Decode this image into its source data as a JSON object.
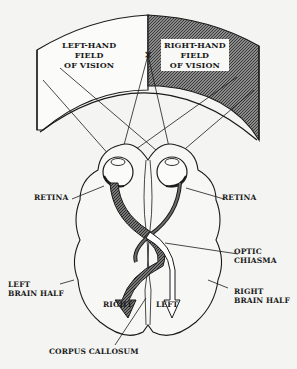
{
  "diagram": {
    "type": "visual-pathway",
    "colors": {
      "background": "#f4f4f2",
      "line": "#1a1a1a",
      "shaded_field": "#6b6b6b",
      "optic_nerve_right_field": "#5a5a5a",
      "optic_nerve_left_field": "#ffffff"
    },
    "labels": {
      "left_field": [
        "LEFT-HAND",
        "FIELD",
        "OF VISION"
      ],
      "right_field": [
        "RIGHT-HAND",
        "FIELD",
        "OF VISION"
      ],
      "fixation_mark": "×",
      "retina_left": "RETINA",
      "retina_right": "RETINA",
      "optic_chiasma": [
        "OPTIC",
        "CHIASMA"
      ],
      "left_brain_half": [
        "LEFT",
        "BRAIN HALF"
      ],
      "right_brain_half": [
        "RIGHT",
        "BRAIN HALF"
      ],
      "arrow_right": "RIGHT",
      "arrow_left": "LEFT",
      "corpus_callosum": "CORPUS CALLOSUM"
    }
  }
}
